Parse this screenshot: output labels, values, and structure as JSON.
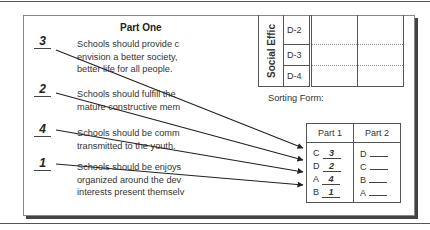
{
  "part_one": {
    "title": "Part One",
    "statements": [
      {
        "number": "3",
        "lines": [
          "Schools should provide c",
          "envision a better society,",
          "better life for all people."
        ]
      },
      {
        "number": "2",
        "lines": [
          "Schools should fulfill the",
          "mature constructive mem"
        ]
      },
      {
        "number": "4",
        "lines": [
          "Schools should be comm",
          "transmitted to the youth."
        ]
      },
      {
        "number": "1",
        "lines": [
          "Schools should be enjoys",
          "organized around the dev",
          "interests present themselv"
        ]
      }
    ]
  },
  "upper_table": {
    "category_label": "Social Effic",
    "rows": [
      "D-2",
      "D-3",
      "D-4"
    ]
  },
  "sorting_form": {
    "label": "Sorting Form:",
    "headers": [
      "Part 1",
      "Part 2"
    ],
    "rows": [
      {
        "p1_letter": "C",
        "p1_answer": "3",
        "p2_letter": "D"
      },
      {
        "p1_letter": "D",
        "p1_answer": "2",
        "p2_letter": "C"
      },
      {
        "p1_letter": "A",
        "p1_answer": "4",
        "p2_letter": "B"
      },
      {
        "p1_letter": "B",
        "p1_answer": "1",
        "p2_letter": "A"
      }
    ]
  }
}
